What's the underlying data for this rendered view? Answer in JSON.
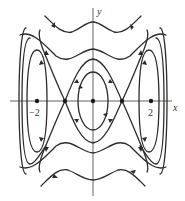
{
  "diagram": {
    "type": "phase-portrait",
    "axes": {
      "x_label": "x",
      "y_label": "y",
      "tick_labels": [
        "−2",
        "2"
      ]
    },
    "equilibria": [
      {
        "kind": "center",
        "x": -2,
        "y": 0
      },
      {
        "kind": "saddle",
        "x": -1,
        "y": 0
      },
      {
        "kind": "center",
        "x": 0,
        "y": 0
      },
      {
        "kind": "saddle",
        "x": 1,
        "y": 0
      },
      {
        "kind": "center",
        "x": 2,
        "y": 0
      }
    ],
    "trajectories": {
      "central_closed_orbits": 1,
      "separatrices": "heteroclinic X through saddles at x=±1",
      "outer_closed_orbits_per_side": 3,
      "wavy_open_orbits_top": 2,
      "wavy_open_orbits_bottom": 2
    },
    "colors": {
      "line": "#2b2b2b",
      "axis": "#3a3a3a",
      "background": "#ffffff"
    }
  }
}
